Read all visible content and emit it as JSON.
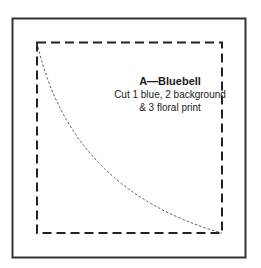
{
  "template": {
    "piece_title": "A—Bluebell",
    "instructions": [
      "Cut 1 blue, 2 background",
      "& 3 floral print"
    ]
  },
  "colors": {
    "stroke": "#222222",
    "background": "#ffffff"
  }
}
